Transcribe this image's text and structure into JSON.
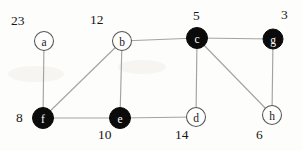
{
  "figure": {
    "kind": "undirected-graph",
    "background_color": "#fdfdfb",
    "edge_color": "#a3a3a3",
    "filled_node_color": "#0b0b0b",
    "empty_node_color": "#fefefe",
    "node_outline_color": "#555555",
    "weight_text_color": "#171717"
  },
  "nodes": [
    {
      "id": "a",
      "label": "a",
      "x": 44,
      "y": 41,
      "r": 9.5,
      "filled": false,
      "weight": "23",
      "weight_x": 11,
      "weight_y": 14
    },
    {
      "id": "b",
      "label": "b",
      "x": 122,
      "y": 41,
      "r": 9.5,
      "filled": false,
      "weight": "12",
      "weight_x": 90,
      "weight_y": 13
    },
    {
      "id": "c",
      "label": "c",
      "x": 197,
      "y": 38,
      "r": 10.5,
      "filled": true,
      "weight": "5",
      "weight_x": 193,
      "weight_y": 9
    },
    {
      "id": "g",
      "label": "g",
      "x": 273,
      "y": 39,
      "r": 10.0,
      "filled": true,
      "weight": "3",
      "weight_x": 281,
      "weight_y": 8
    },
    {
      "id": "f",
      "label": "f",
      "x": 43,
      "y": 118,
      "r": 10.5,
      "filled": true,
      "weight": "8",
      "weight_x": 16,
      "weight_y": 111
    },
    {
      "id": "e",
      "label": "e",
      "x": 120,
      "y": 118,
      "r": 10.5,
      "filled": true,
      "weight": "10",
      "weight_x": 98,
      "weight_y": 128
    },
    {
      "id": "d",
      "label": "d",
      "x": 196,
      "y": 117,
      "r": 9.5,
      "filled": false,
      "weight": "14",
      "weight_x": 175,
      "weight_y": 128
    },
    {
      "id": "h",
      "label": "h",
      "x": 272,
      "y": 115,
      "r": 9.5,
      "filled": false,
      "weight": "6",
      "weight_x": 256,
      "weight_y": 128
    }
  ],
  "edges": [
    {
      "from": "a",
      "to": "f"
    },
    {
      "from": "b",
      "to": "c"
    },
    {
      "from": "b",
      "to": "e"
    },
    {
      "from": "b",
      "to": "f"
    },
    {
      "from": "c",
      "to": "g"
    },
    {
      "from": "c",
      "to": "d"
    },
    {
      "from": "c",
      "to": "h"
    },
    {
      "from": "g",
      "to": "h"
    },
    {
      "from": "f",
      "to": "e"
    },
    {
      "from": "e",
      "to": "d"
    }
  ]
}
